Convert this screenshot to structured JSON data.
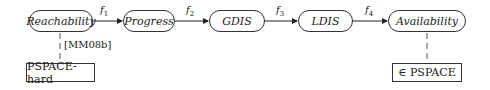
{
  "nodes": [
    {
      "id": "reachability",
      "label": "Reachability"
    },
    {
      "id": "progress",
      "label": "Progress"
    },
    {
      "id": "gdis",
      "label": "GDIS"
    },
    {
      "id": "ldis",
      "label": "LDIS"
    },
    {
      "id": "availability",
      "label": "Availability"
    }
  ],
  "edges": [
    {
      "from": "reachability",
      "to": "progress",
      "label": "f",
      "sub": "1"
    },
    {
      "from": "progress",
      "to": "gdis",
      "label": "f",
      "sub": "2"
    },
    {
      "from": "gdis",
      "to": "ldis",
      "label": "f",
      "sub": "3"
    },
    {
      "from": "ldis",
      "to": "availability",
      "label": "f",
      "sub": "4"
    }
  ],
  "annotations": {
    "left": {
      "citation": "[MM08b]",
      "box": "PSPACE-hard"
    },
    "right": {
      "box": "∈ PSPACE"
    }
  }
}
